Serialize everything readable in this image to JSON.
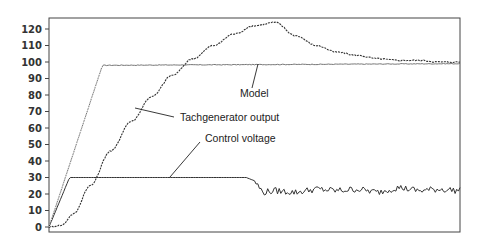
{
  "chart_data": {
    "type": "line",
    "title": "",
    "xlabel": "",
    "ylabel": "",
    "ylim": [
      0,
      125
    ],
    "xlim": [
      0,
      100
    ],
    "yticks": [
      0,
      10,
      20,
      30,
      40,
      50,
      60,
      70,
      80,
      90,
      100,
      110,
      120
    ],
    "grid": false,
    "legend": "none (inline annotations)",
    "annotations": [
      {
        "label": "Model",
        "series": "Model"
      },
      {
        "label": "Tachgenerator output",
        "series": "Tachgenerator output"
      },
      {
        "label": "Control voltage",
        "series": "Control voltage"
      }
    ],
    "series": [
      {
        "name": "Model",
        "style": "dotted then solid thin",
        "x": [
          0,
          13,
          100
        ],
        "values": [
          0,
          98,
          99
        ]
      },
      {
        "name": "Tachgenerator output",
        "style": "dashed/noisy",
        "x": [
          0,
          3,
          6,
          10,
          15,
          20,
          25,
          30,
          35,
          40,
          45,
          50,
          55,
          60,
          65,
          70,
          75,
          80,
          85,
          90,
          95,
          100
        ],
        "values": [
          0,
          1,
          8,
          25,
          46,
          64,
          79,
          92,
          102,
          110,
          117,
          122,
          124,
          116,
          110,
          106,
          104,
          102,
          101,
          101,
          100,
          100
        ]
      },
      {
        "name": "Control voltage",
        "style": "solid then noisy",
        "x": [
          0,
          5,
          48,
          50,
          52,
          55,
          60,
          65,
          70,
          75,
          80,
          85,
          90,
          95,
          100
        ],
        "values": [
          0,
          30,
          30,
          28,
          21,
          22,
          21,
          23,
          22,
          23,
          21,
          24,
          22,
          23,
          22
        ]
      }
    ]
  },
  "labels": {
    "model": "Model",
    "tach": "Tachgenerator output",
    "control": "Control voltage"
  },
  "axis": {
    "y_ticks": [
      "120",
      "110",
      "100",
      "90",
      "80",
      "70",
      "60",
      "50",
      "40",
      "30",
      "20",
      "10",
      "0"
    ]
  }
}
